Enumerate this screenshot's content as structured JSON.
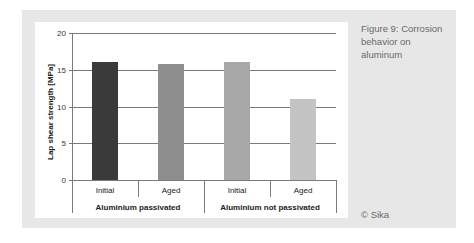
{
  "figure": {
    "caption": "Figure 9: Corrosion behavior on aluminum",
    "copyright": "© Sika",
    "panel_color": "#e7e7e7"
  },
  "chart_data": {
    "type": "bar",
    "title": "",
    "xlabel": "",
    "ylabel": "Lap shear strength [MPa]",
    "ylim": [
      0,
      20
    ],
    "yticks": [
      0,
      5,
      10,
      15,
      20
    ],
    "grid": true,
    "legend": null,
    "groups": [
      {
        "label": "Aluminium passivated",
        "categories": [
          "Initial",
          "Aged"
        ]
      },
      {
        "label": "Aluminium not passivated",
        "categories": [
          "Initial",
          "Aged"
        ]
      }
    ],
    "categories": [
      "Initial",
      "Aged",
      "Initial",
      "Aged"
    ],
    "values": [
      16.1,
      15.8,
      16.1,
      11.0
    ],
    "colors": [
      "#3a3a3a",
      "#8e8e8e",
      "#a8a8a8",
      "#c4c4c4"
    ]
  }
}
